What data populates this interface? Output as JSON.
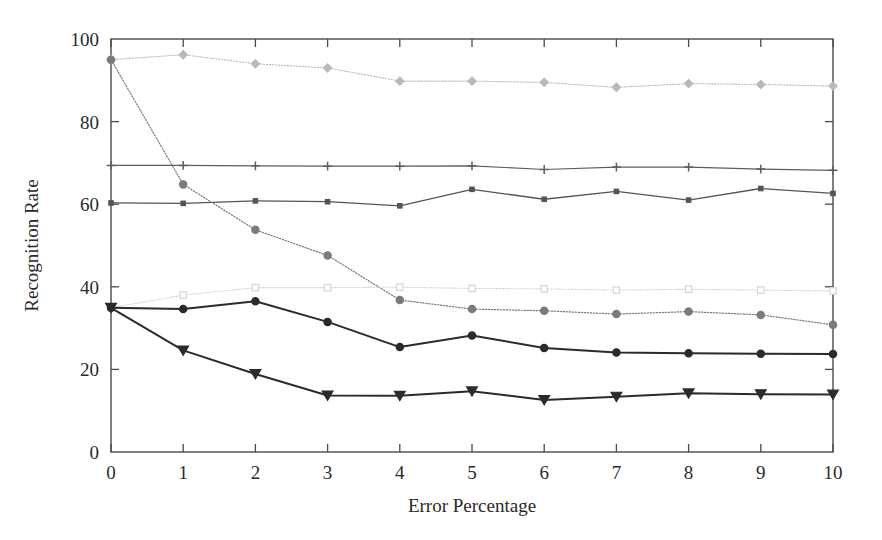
{
  "figure": {
    "background_color": "#ffffff",
    "frame_color": "#4a4a4a"
  },
  "chart_data": {
    "type": "line",
    "title": "",
    "xlabel": "Error Percentage",
    "ylabel": "Recognition Rate",
    "x": [
      0,
      1,
      2,
      3,
      4,
      5,
      6,
      7,
      8,
      9,
      10
    ],
    "xlim": [
      0,
      10
    ],
    "ylim": [
      0,
      100
    ],
    "xticks": [
      "0",
      "1",
      "2",
      "3",
      "4",
      "5",
      "6",
      "7",
      "8",
      "9",
      "10"
    ],
    "yticks": [
      "0",
      "20",
      "40",
      "60",
      "80",
      "100"
    ],
    "grid": false,
    "legend": "none",
    "series": [
      {
        "name": "series-1",
        "values": [
          95.0,
          96.2,
          94.0,
          93.0,
          89.8,
          89.8,
          89.5,
          88.3,
          89.2,
          89.0,
          88.6
        ],
        "color": "#b9b9b9",
        "marker": "diamond",
        "marker_filled": true,
        "linestyle": "dotted",
        "linewidth": 1.1
      },
      {
        "name": "series-2",
        "values": [
          69.4,
          69.4,
          69.3,
          69.2,
          69.2,
          69.3,
          68.4,
          69.0,
          69.0,
          68.5,
          68.2
        ],
        "color": "#5e5e5e",
        "marker": "plus",
        "marker_filled": true,
        "linestyle": "solid",
        "linewidth": 1.2
      },
      {
        "name": "series-3",
        "values": [
          60.3,
          60.2,
          60.8,
          60.6,
          59.6,
          63.6,
          61.2,
          63.1,
          61.0,
          63.8,
          62.6
        ],
        "color": "#555555",
        "marker": "square",
        "marker_filled": true,
        "linestyle": "solid",
        "linewidth": 1.3
      },
      {
        "name": "series-4",
        "values": [
          95.0,
          64.8,
          53.8,
          47.6,
          36.8,
          34.6,
          34.2,
          33.4,
          34.0,
          33.2,
          30.8
        ],
        "color": "#7b7b7b",
        "marker": "circle",
        "marker_filled": true,
        "linestyle": "dotted",
        "linewidth": 1.2
      },
      {
        "name": "series-5",
        "values": [
          34.9,
          38.0,
          39.8,
          39.8,
          39.9,
          39.6,
          39.5,
          39.2,
          39.4,
          39.2,
          39.0
        ],
        "color": "#d5d5d5",
        "marker": "square-open",
        "marker_filled": false,
        "linestyle": "dotted",
        "linewidth": 1.1
      },
      {
        "name": "series-6",
        "values": [
          34.9,
          34.6,
          36.5,
          31.5,
          25.4,
          28.2,
          25.2,
          24.1,
          23.9,
          23.8,
          23.7
        ],
        "color": "#2b2b2b",
        "marker": "circle",
        "marker_filled": true,
        "linestyle": "solid",
        "linewidth": 2.0
      },
      {
        "name": "series-7",
        "values": [
          34.9,
          24.6,
          18.9,
          13.7,
          13.6,
          14.7,
          12.6,
          13.4,
          14.2,
          14.0,
          13.9
        ],
        "color": "#2b2b2b",
        "marker": "triangle-down",
        "marker_filled": true,
        "linestyle": "solid",
        "linewidth": 2.0
      }
    ]
  }
}
